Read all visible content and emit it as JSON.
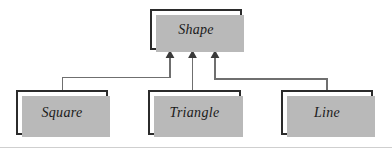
{
  "diagram": {
    "type": "uml-class-generalization",
    "colors": {
      "background": "#ffffff",
      "box_fill": "#ffffff",
      "box_border": "#2b2b2b",
      "box_shadow": "#b9b9b9",
      "connector": "#6f6f6f",
      "arrowhead": "#3a3a3a",
      "bottom_rule": "#cfcfcf"
    },
    "nodes": {
      "shape": {
        "label": "Shape"
      },
      "square": {
        "label": "Square"
      },
      "triangle": {
        "label": "Triangle"
      },
      "line": {
        "label": "Line"
      }
    },
    "edges": [
      {
        "from": "square",
        "to": "shape",
        "kind": "generalization",
        "arrow": "filled-triangle-up"
      },
      {
        "from": "triangle",
        "to": "shape",
        "kind": "generalization",
        "arrow": "filled-triangle-up"
      },
      {
        "from": "line",
        "to": "shape",
        "kind": "generalization",
        "arrow": "filled-triangle-up"
      }
    ]
  }
}
